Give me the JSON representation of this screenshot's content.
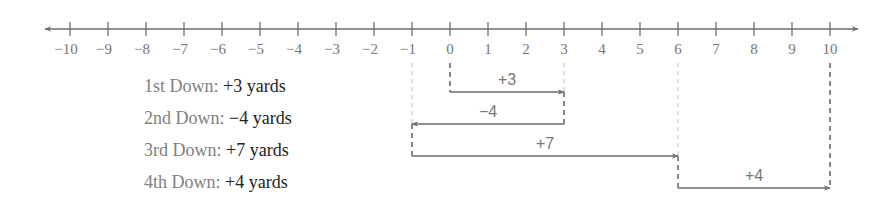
{
  "diagram": {
    "number_line": {
      "min": -10,
      "max": 10,
      "ticks": [
        "−10",
        "−9",
        "−8",
        "−7",
        "−6",
        "−5",
        "−4",
        "−3",
        "−2",
        "−1",
        "0",
        "1",
        "2",
        "3",
        "4",
        "5",
        "6",
        "7",
        "8",
        "9",
        "10"
      ],
      "tick_values": [
        -10,
        -9,
        -8,
        -7,
        -6,
        -5,
        -4,
        -3,
        -2,
        -1,
        0,
        1,
        2,
        3,
        4,
        5,
        6,
        7,
        8,
        9,
        10
      ]
    },
    "downs": [
      {
        "name": "1st Down:",
        "value": "+3 yards",
        "label": "+3",
        "start": 0,
        "end": 3
      },
      {
        "name": "2nd Down:",
        "value": "−4 yards",
        "label": "−4",
        "start": 3,
        "end": -1
      },
      {
        "name": "3rd Down:",
        "value": "+7 yards",
        "label": "+7",
        "start": -1,
        "end": 6
      },
      {
        "name": "4th Down:",
        "value": "+4 yards",
        "label": "+4",
        "start": 6,
        "end": 10
      }
    ],
    "colors": {
      "axis": "#6e6e6e",
      "arrow": "#6e6e6e",
      "guide_light": "#bdbdbd",
      "guide_dark": "#555555"
    }
  }
}
